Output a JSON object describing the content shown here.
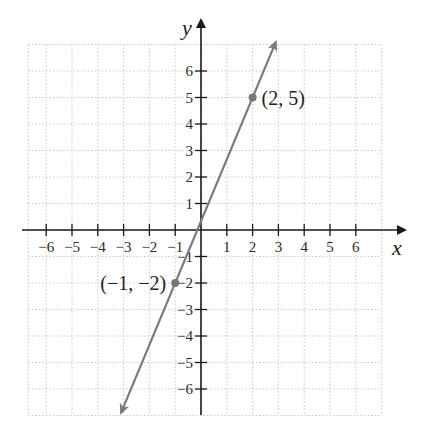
{
  "chart_data": {
    "type": "line",
    "title": "",
    "xlabel": "x",
    "ylabel": "y",
    "xlim": [
      -6.5,
      6.5
    ],
    "ylim": [
      -7,
      7
    ],
    "grid": true,
    "x_ticks": [
      -6,
      -5,
      -4,
      -3,
      -2,
      -1,
      1,
      2,
      3,
      4,
      5,
      6
    ],
    "y_ticks": [
      -6,
      -5,
      -4,
      -3,
      -2,
      -1,
      1,
      2,
      3,
      4,
      5,
      6
    ],
    "x_tick_labels": [
      "−6",
      "−5",
      "−4",
      "−3",
      "−2",
      "−1",
      "1",
      "2",
      "3",
      "4",
      "5",
      "6"
    ],
    "y_tick_labels": [
      "−6",
      "−5",
      "−4",
      "−3",
      "−2",
      "−1",
      "1",
      "2",
      "3",
      "4",
      "5",
      "6"
    ],
    "series": [
      {
        "name": "line through (-1,-2) and (2,5)",
        "slope": 2.3333,
        "intercept": 0.3333,
        "x": [
          -3.1,
          2.9
        ],
        "y": [
          -6.9,
          7.1
        ],
        "arrows_both_ends": true,
        "color": "#7a7a7a"
      }
    ],
    "points": [
      {
        "x": 2,
        "y": 5,
        "label": "(2, 5)"
      },
      {
        "x": -1,
        "y": -2,
        "label": "(−1, −2)"
      }
    ],
    "annotations": [
      "(2, 5)",
      "(−1, −2)"
    ]
  },
  "colors": {
    "axis": "#1a1a1a",
    "grid": "#c8c8c8",
    "line": "#7a7a7a",
    "point": "#777777"
  }
}
